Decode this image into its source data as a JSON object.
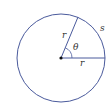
{
  "diagram": {
    "type": "circle-arc-length",
    "labels": {
      "radius_top": "r",
      "radius_right": "r",
      "angle": "θ",
      "arc": "s"
    },
    "colors": {
      "circle": "#4a5a9c",
      "radius": "#4a5a9c",
      "center": "#111111",
      "text": "#333333"
    }
  }
}
